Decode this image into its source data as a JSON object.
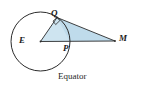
{
  "figure": {
    "caption": "Equator",
    "background_color": "#ffffff",
    "stroke_color": "#2b2b2b",
    "fill_color": "#bcd9ea",
    "fill_color_light": "#d3e6f2",
    "labels": [
      {
        "id": "Q",
        "text": "Q",
        "role": "tangent-point"
      },
      {
        "id": "E",
        "text": "E",
        "role": "circle-center"
      },
      {
        "id": "P",
        "text": "P",
        "role": "circle-point-on-EM"
      },
      {
        "id": "M",
        "text": "M",
        "role": "external-point"
      }
    ],
    "circle": {
      "center_x": 40.5,
      "center_y": 41.5,
      "radius": 29.5,
      "label": "Earth"
    },
    "points": {
      "E": {
        "x": 40.5,
        "y": 41.5
      },
      "Q": {
        "x": 57.0,
        "y": 17.5
      },
      "P": {
        "x": 70.0,
        "y": 41.5
      },
      "M": {
        "x": 115.0,
        "y": 41.0
      }
    },
    "segments": [
      {
        "from": "E",
        "to": "Q",
        "name": "radius-EQ"
      },
      {
        "from": "E",
        "to": "M",
        "name": "segment-EM"
      },
      {
        "from": "Q",
        "to": "M",
        "name": "tangent-QM"
      }
    ],
    "right_angle": {
      "at": "Q",
      "marker": "square",
      "size": 5
    }
  }
}
